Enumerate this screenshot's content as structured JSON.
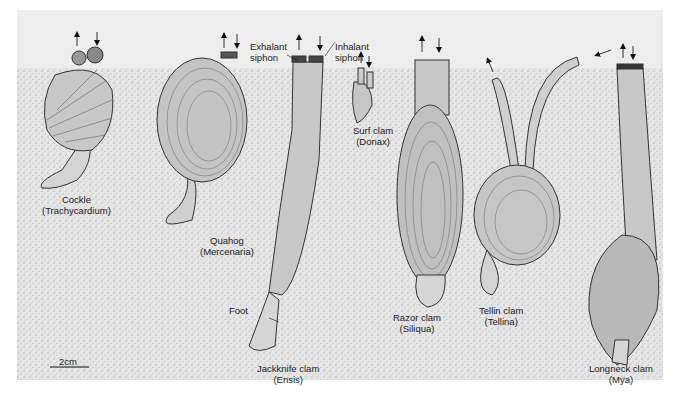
{
  "figure": {
    "scale_bar": {
      "label": "2cm"
    },
    "colors": {
      "water": "#ececec",
      "sediment": "#e3e3e3",
      "shell": "#c9c9c9",
      "outline": "#333333"
    },
    "annotations": {
      "exhalant": [
        "Exhalant",
        "siphon"
      ],
      "inhalant": [
        "Inhalant",
        "siphon"
      ],
      "foot": "Foot"
    },
    "species": [
      {
        "common": "Cockle",
        "genus": "(Trachycardium)"
      },
      {
        "common": "Quahog",
        "genus": "(Mercenaria)"
      },
      {
        "common": "Jackknife clam",
        "genus": "(Ensis)"
      },
      {
        "common": "Surf clam",
        "genus": "(Donax)"
      },
      {
        "common": "Razor clam",
        "genus": "(Siliqua)"
      },
      {
        "common": "Tellin clam",
        "genus": "(Tellina)"
      },
      {
        "common": "Longneck clam",
        "genus": "(Mya)"
      }
    ]
  }
}
